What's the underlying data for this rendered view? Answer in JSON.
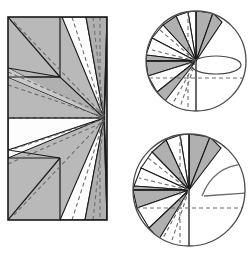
{
  "figure": {
    "colors": {
      "paper_gray": "#b9b9b9",
      "paper_gray_dark": "#a9a9a9",
      "paper_white": "#fefefe",
      "stroke": "#1a1a1a",
      "crease_dashed": "#6e6e6e",
      "circle_outline": "#4a4a4a",
      "arrow": "#5a5a5a"
    },
    "panels": [
      {
        "id": "crease-pattern",
        "name": "Rectangular crease pattern",
        "shape": "rectangle",
        "bounds": {
          "x": 8,
          "y": 17,
          "width": 99,
          "height": 203
        },
        "pivot_point": {
          "x": 104,
          "y": 118
        },
        "flap_count": 8,
        "horizontal_creases_y": [
          77,
          118,
          158
        ],
        "vertical_crease_x": 60
      },
      {
        "id": "step-1-circle",
        "name": "First collapsed step",
        "shape": "circle",
        "center": {
          "x": 196,
          "y": 61
        },
        "radius": 50,
        "arrow": "rotation-ellipse",
        "wedge_count": 9
      },
      {
        "id": "step-2-circle",
        "name": "Second collapsed step",
        "shape": "circle",
        "center": {
          "x": 189,
          "y": 190
        },
        "radius": 56,
        "arrow": "curved-fold-arrow",
        "wedge_count": 9
      }
    ]
  }
}
